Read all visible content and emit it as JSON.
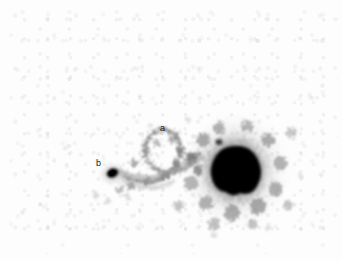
{
  "figure": {
    "kind": "astronomical-negative-grayscale-image",
    "width": 342,
    "height": 260,
    "background_color": "#ffffff",
    "sky_color": "#fdfdfd",
    "ink_color": "#000000"
  },
  "annotations": [
    {
      "id": "a",
      "label": "a",
      "x": 164,
      "y": 129,
      "describes": "tidal-feature-a"
    },
    {
      "id": "b",
      "label": "b",
      "x": 100,
      "y": 164,
      "describes": "companion-knot-b"
    }
  ],
  "objects": {
    "primary_galaxy": {
      "name": "primary-galaxy",
      "center_x": 236,
      "center_y": 170,
      "core_width": 48,
      "core_height": 46,
      "halo_width": 118,
      "halo_height": 124,
      "color": "#000000"
    },
    "companion_knot": {
      "name": "companion-knot-b",
      "center_x": 113,
      "center_y": 173,
      "width": 15,
      "height": 12,
      "color": "#0d0d0d"
    },
    "tidal_bridge": {
      "name": "tidal-bridge",
      "from_x": 118,
      "from_y": 170,
      "to_x": 196,
      "to_y": 168,
      "color": "#8c8c8c"
    },
    "tidal_loop": {
      "name": "tidal-loop-a",
      "center_x": 172,
      "center_y": 152,
      "radius_x": 40,
      "radius_y": 30,
      "color": "#9a9a9a"
    }
  }
}
